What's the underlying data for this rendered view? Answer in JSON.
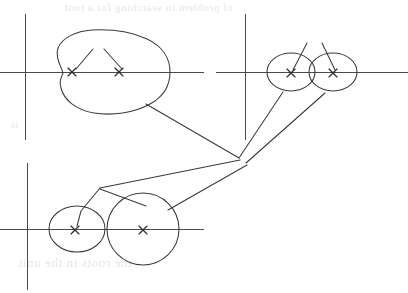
{
  "figure": {
    "background_color": "#ffffff",
    "line_color": "#3a3a3a",
    "axis_color": "#4a4a4a",
    "marker_color": "#2e2e2e",
    "ghost_color": "#e9e7e4",
    "width": 408,
    "height": 293
  },
  "ghost_text": {
    "top": "of problem in searching for a root",
    "middle": "is",
    "bottom": "the roots in the unit"
  },
  "panels": [
    {
      "id": "panel-top-left",
      "name": "top-left-panel",
      "label": "Top-left panel: single enclosing region containing two roots",
      "axes": {
        "origin_x": 25,
        "origin_y": 72,
        "x_axis_start": 0,
        "x_axis_end": 204,
        "y_axis_top": 14,
        "y_axis_bottom": 140
      },
      "region": {
        "shape": "closed-blob",
        "description": "large closed curve with concave dimple on left side crossing the real axis"
      },
      "markers": [
        {
          "name": "root-marker-1",
          "x": 72,
          "y": 72,
          "glyph": "x"
        },
        {
          "name": "root-marker-2",
          "x": 119,
          "y": 72,
          "glyph": "x"
        }
      ],
      "pointer_lines": [
        {
          "name": "pointer-to-root-1",
          "from_x": 92,
          "from_y": 50,
          "to_x": 75,
          "to_y": 70
        },
        {
          "name": "pointer-to-root-2",
          "from_x": 105,
          "from_y": 50,
          "to_x": 122,
          "to_y": 70
        }
      ]
    },
    {
      "id": "panel-top-right",
      "name": "top-right-panel",
      "label": "Top-right panel: two small overlapping ellipses, one root each",
      "axes": {
        "origin_x": 245,
        "origin_y": 72,
        "x_axis_start": 216,
        "x_axis_end": 408,
        "y_axis_top": 14,
        "y_axis_bottom": 140
      },
      "regions": [
        {
          "name": "ellipse-region-left",
          "cx": 291,
          "cy": 72,
          "rx": 24,
          "ry": 19
        },
        {
          "name": "ellipse-region-right",
          "cx": 333,
          "cy": 72,
          "rx": 24,
          "ry": 19
        }
      ],
      "markers": [
        {
          "name": "root-marker-1",
          "x": 291,
          "y": 73,
          "glyph": "x"
        },
        {
          "name": "root-marker-2",
          "x": 333,
          "y": 73,
          "glyph": "x"
        }
      ],
      "pointer_lines": [
        {
          "name": "pointer-to-root-1",
          "from_x": 306,
          "from_y": 44,
          "to_x": 293,
          "to_y": 70
        },
        {
          "name": "pointer-to-root-2",
          "from_x": 323,
          "from_y": 44,
          "to_x": 335,
          "to_y": 70
        }
      ]
    },
    {
      "id": "panel-bottom-left",
      "name": "bottom-left-panel",
      "label": "Bottom-left panel: two separated circles, one root each",
      "axes": {
        "origin_x": 27,
        "origin_y": 229,
        "x_axis_start": 0,
        "x_axis_end": 204,
        "y_axis_top": 163,
        "y_axis_bottom": 290
      },
      "regions": [
        {
          "name": "circle-region-small",
          "cx": 77,
          "cy": 229,
          "rx": 27,
          "ry": 22
        },
        {
          "name": "circle-region-large",
          "cx": 143,
          "cy": 229,
          "rx": 35,
          "ry": 35
        }
      ],
      "markers": [
        {
          "name": "root-marker-1",
          "x": 75,
          "y": 230,
          "glyph": "x"
        },
        {
          "name": "root-marker-2",
          "x": 143,
          "y": 230,
          "glyph": "x"
        }
      ],
      "pointer_lines": [
        {
          "name": "pointer-polyline-to-root-1",
          "points": "100,188 82,212 78,227"
        },
        {
          "name": "pointer-branch-to-root-1",
          "points": "100,188 143,205"
        }
      ]
    }
  ],
  "connectors": [
    {
      "name": "connector-top-left-to-hub",
      "description": "leader from top-left region boundary down-right to convergence hub",
      "from_x": 146,
      "from_y": 104,
      "to_x": 239,
      "to_y": 158
    },
    {
      "name": "connector-hub-to-top-right-left-ellipse",
      "description": "leader from convergence hub up-right to left ellipse lower boundary",
      "from_x": 239,
      "from_y": 158,
      "to_x": 283,
      "to_y": 92
    },
    {
      "name": "connector-hub-to-top-right-right-ellipse",
      "description": "leader from convergence hub up-right to right ellipse lower boundary",
      "from_x": 246,
      "from_y": 162,
      "to_x": 325,
      "to_y": 93
    },
    {
      "name": "connector-hub-to-bottom-polyline",
      "description": "leader from convergence hub down-left into bottom panel polyline apex",
      "from_x": 240,
      "from_y": 160,
      "to_x": 100,
      "to_y": 188
    },
    {
      "name": "connector-hub-to-bottom-large-circle",
      "description": "leader from convergence hub down-left to large circle upper-right boundary",
      "from_x": 246,
      "from_y": 164,
      "to_x": 168,
      "to_y": 210
    }
  ]
}
